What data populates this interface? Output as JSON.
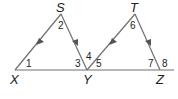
{
  "diagram": {
    "vertices": {
      "S": {
        "label": "S",
        "x": 61,
        "y": 14
      },
      "T": {
        "label": "T",
        "x": 135,
        "y": 14
      },
      "X": {
        "label": "X",
        "x": 15,
        "y": 70
      },
      "Y": {
        "label": "Y",
        "x": 87,
        "y": 70
      },
      "Z": {
        "label": "Z",
        "x": 160,
        "y": 70
      }
    },
    "angles": {
      "a1": "1",
      "a2": "2",
      "a3": "3",
      "a4": "4",
      "a5": "5",
      "a6": "6",
      "a7": "7",
      "a8": "8"
    },
    "line_color": "#707070",
    "arrow_color": "#555555",
    "parallel_marks": [
      "SX ∥ TY (single arrows)",
      "SY ∥ TZ (single arrows)"
    ]
  }
}
